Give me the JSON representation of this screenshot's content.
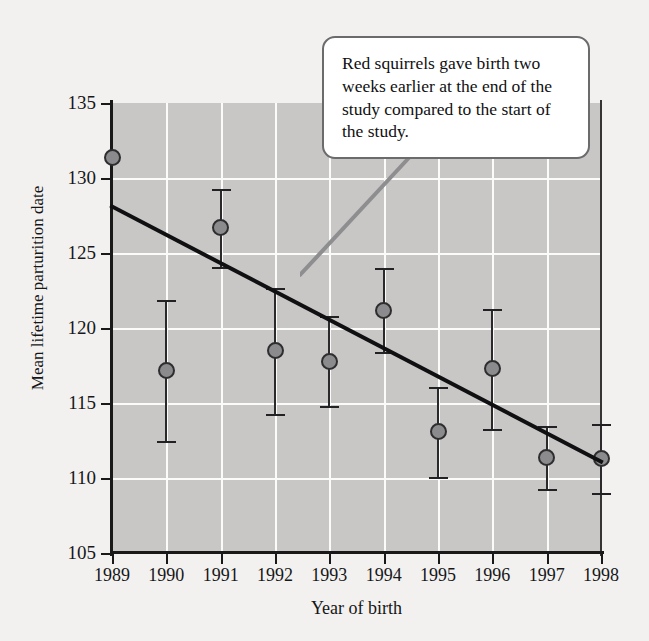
{
  "chart_data": {
    "type": "scatter",
    "title": "",
    "xlabel": "Year of birth",
    "ylabel": "Mean lifetime parturition date",
    "x": [
      1989,
      1990,
      1991,
      1992,
      1993,
      1994,
      1995,
      1996,
      1997,
      1998
    ],
    "categories": [
      "1989",
      "1990",
      "1991",
      "1992",
      "1993",
      "1994",
      "1995",
      "1996",
      "1997",
      "1998"
    ],
    "values": [
      131.4,
      117.2,
      126.7,
      118.5,
      117.8,
      121.2,
      113.1,
      117.3,
      111.4,
      111.3
    ],
    "error_upper": [
      0.0,
      4.7,
      2.6,
      4.2,
      3.0,
      2.8,
      3.0,
      4.0,
      2.1,
      2.3
    ],
    "error_lower": [
      0.0,
      4.7,
      2.6,
      4.2,
      3.0,
      2.8,
      3.0,
      4.0,
      2.1,
      2.3
    ],
    "xlim": [
      1989,
      1998
    ],
    "ylim": [
      105,
      135
    ],
    "ytick_labels": [
      "135",
      "130",
      "125",
      "120",
      "115",
      "110",
      "105"
    ],
    "ytick_values": [
      135,
      130,
      125,
      120,
      115,
      110,
      105
    ],
    "xtick_labels": [
      "1989",
      "1990",
      "1991",
      "1992",
      "1993",
      "1994",
      "1995",
      "1996",
      "1997",
      "1998"
    ],
    "grid": true,
    "grid_color": "#fbfbfa",
    "plot_background": "#c8c7c5",
    "marker_color": "#8b8b8d",
    "marker_edge_color": "#2e2e30",
    "errorbar_color": "#2a2a2c",
    "legend": null,
    "series": [
      {
        "name": "Mean lifetime parturition date",
        "values": [
          131.4,
          117.2,
          126.7,
          118.5,
          117.8,
          121.2,
          113.1,
          117.3,
          111.4,
          111.3
        ]
      }
    ],
    "trendline": {
      "type": "linear",
      "x_start": 1989,
      "y_start": 128.1,
      "x_end": 1998,
      "y_end": 111.1,
      "color": "#101012"
    }
  },
  "annotation": {
    "text": "Red squirrels gave birth two weeks earlier at the end of the study compared to the start of the study.",
    "leader_color": "#8e8e90"
  }
}
